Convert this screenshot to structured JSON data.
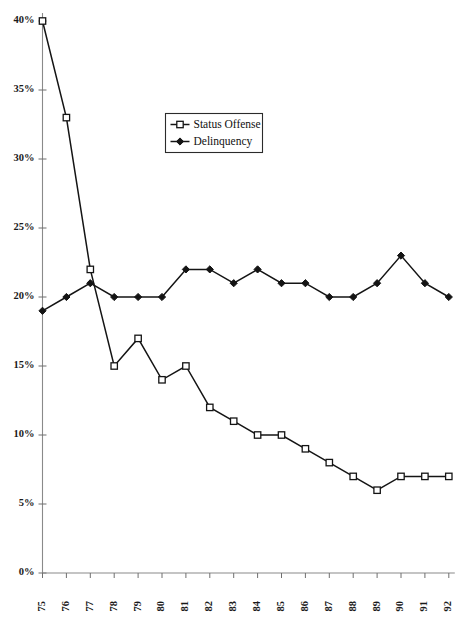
{
  "chart_data": {
    "type": "line",
    "title": "",
    "xlabel": "",
    "ylabel": "",
    "categories": [
      "75",
      "76",
      "77",
      "78",
      "79",
      "80",
      "81",
      "82",
      "83",
      "84",
      "85",
      "86",
      "87",
      "88",
      "89",
      "90",
      "91",
      "92"
    ],
    "ylim": [
      0,
      40
    ],
    "ytick_step": 5,
    "ytick_labels": [
      "0%",
      "5%",
      "10%",
      "15%",
      "20%",
      "25%",
      "30%",
      "35%",
      "40%"
    ],
    "ytick_values": [
      0,
      5,
      10,
      15,
      20,
      25,
      30,
      35,
      40
    ],
    "grid": false,
    "legend_position": "upper-center",
    "series": [
      {
        "name": "Status Offense",
        "marker": "open-square",
        "values": [
          40,
          33,
          22,
          15,
          17,
          14,
          15,
          12,
          11,
          10,
          10,
          9,
          8,
          7,
          6,
          7,
          7,
          7
        ]
      },
      {
        "name": "Delinquency",
        "marker": "filled-diamond",
        "values": [
          19,
          20,
          21,
          20,
          20,
          20,
          22,
          22,
          21,
          22,
          21,
          21,
          20,
          20,
          21,
          23,
          21,
          20
        ]
      }
    ]
  },
  "legend": {
    "items": [
      {
        "label": "Status Offense",
        "marker": "open-square"
      },
      {
        "label": "Delinquency",
        "marker": "filled-diamond"
      }
    ]
  },
  "caption": {
    "text": ""
  },
  "colors": {
    "line": "#141414",
    "axis": "#8a8a8a",
    "background": "#ffffff",
    "text": "#1a1a1a"
  }
}
